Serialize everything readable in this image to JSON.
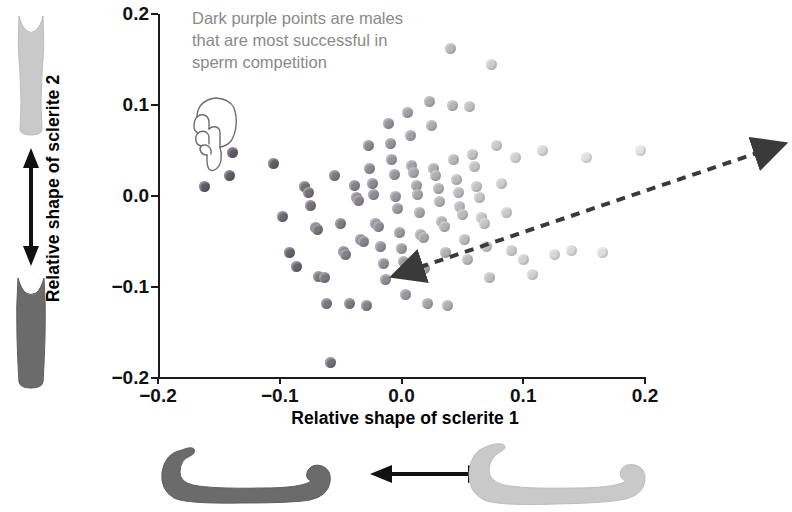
{
  "figure": {
    "annotation": "Dark purple points are males that are most successful in sperm competition",
    "annotation_lines": [
      "Dark purple points are males",
      "that are most successful in",
      "sperm competition"
    ],
    "hand_icon": "pointing-hand-down-icon",
    "colors": {
      "axis": "#1b1b1b",
      "annotation_text": "#8a8a8a",
      "label_text": "#000000",
      "point_dark": "#5a5360",
      "point_light": "#e4e3e6",
      "trend_arrow": "#3a3a3a",
      "sclerite_dark": "#6b6b6b",
      "sclerite_light": "#c9c9c9"
    },
    "left_illustration": {
      "top_shape_label": "sclerite-2-light-form",
      "bottom_shape_label": "sclerite-2-dark-form",
      "arrow_label": "vertical-double-arrow"
    },
    "bottom_illustration": {
      "left_shape_label": "sclerite-1-dark-form",
      "right_shape_label": "sclerite-1-light-form",
      "arrow_label": "horizontal-double-arrow"
    },
    "trend_line": {
      "style": "dashed-double-headed-arrow",
      "from": [
        -0.115,
        -0.063
      ],
      "to": [
        0.163,
        0.063
      ]
    }
  },
  "chart_data": {
    "type": "scatter",
    "title": "",
    "xlabel": "Relative shape of sclerite 1",
    "ylabel": "Relative shape of sclerite 2",
    "xlim": [
      -0.2,
      0.2
    ],
    "ylim": [
      -0.2,
      0.2
    ],
    "xticks": [
      -0.2,
      -0.1,
      0.0,
      0.1,
      0.2
    ],
    "yticks": [
      -0.2,
      -0.1,
      0.0,
      0.1,
      0.2
    ],
    "xticklabels": [
      "−0.2",
      "−0.1",
      "0.0",
      "0.1",
      "0.2"
    ],
    "yticklabels": [
      "−0.2",
      "−0.1",
      "0.0",
      "0.1",
      "0.2"
    ],
    "grid": false,
    "legend": null,
    "colormap": {
      "description": "point darkness encodes sperm competition success; dark purple = most successful",
      "dark": "#5a5360",
      "light": "#e4e3e6"
    },
    "points": [
      {
        "x": -0.162,
        "y": 0.01,
        "shade": 0.05
      },
      {
        "x": -0.141,
        "y": 0.022,
        "shade": 0.05
      },
      {
        "x": -0.139,
        "y": 0.048,
        "shade": 0.05
      },
      {
        "x": -0.105,
        "y": 0.036,
        "shade": 0.07
      },
      {
        "x": -0.098,
        "y": -0.022,
        "shade": 0.14
      },
      {
        "x": -0.092,
        "y": -0.062,
        "shade": 0.1
      },
      {
        "x": -0.086,
        "y": -0.078,
        "shade": 0.12
      },
      {
        "x": -0.08,
        "y": 0.01,
        "shade": 0.18
      },
      {
        "x": -0.076,
        "y": 0.004,
        "shade": 0.2
      },
      {
        "x": -0.075,
        "y": -0.01,
        "shade": 0.2
      },
      {
        "x": -0.071,
        "y": -0.035,
        "shade": 0.22
      },
      {
        "x": -0.069,
        "y": -0.037,
        "shade": 0.22
      },
      {
        "x": -0.068,
        "y": -0.088,
        "shade": 0.25
      },
      {
        "x": -0.063,
        "y": -0.09,
        "shade": 0.25
      },
      {
        "x": -0.062,
        "y": -0.118,
        "shade": 0.24
      },
      {
        "x": -0.058,
        "y": -0.183,
        "shade": 0.18
      },
      {
        "x": -0.055,
        "y": 0.022,
        "shade": 0.26
      },
      {
        "x": -0.05,
        "y": -0.03,
        "shade": 0.28
      },
      {
        "x": -0.048,
        "y": -0.061,
        "shade": 0.3
      },
      {
        "x": -0.046,
        "y": -0.064,
        "shade": 0.3
      },
      {
        "x": -0.043,
        "y": -0.118,
        "shade": 0.27
      },
      {
        "x": -0.039,
        "y": 0.012,
        "shade": 0.32
      },
      {
        "x": -0.037,
        "y": -0.002,
        "shade": 0.33
      },
      {
        "x": -0.035,
        "y": -0.005,
        "shade": 0.33
      },
      {
        "x": -0.034,
        "y": -0.048,
        "shade": 0.34
      },
      {
        "x": -0.031,
        "y": -0.05,
        "shade": 0.34
      },
      {
        "x": -0.029,
        "y": -0.12,
        "shade": 0.3
      },
      {
        "x": -0.027,
        "y": 0.056,
        "shade": 0.36
      },
      {
        "x": -0.026,
        "y": 0.03,
        "shade": 0.37
      },
      {
        "x": -0.024,
        "y": 0.014,
        "shade": 0.38
      },
      {
        "x": -0.023,
        "y": 0.002,
        "shade": 0.39
      },
      {
        "x": -0.021,
        "y": -0.03,
        "shade": 0.4
      },
      {
        "x": -0.019,
        "y": -0.033,
        "shade": 0.4
      },
      {
        "x": -0.017,
        "y": -0.055,
        "shade": 0.41
      },
      {
        "x": -0.015,
        "y": -0.074,
        "shade": 0.41
      },
      {
        "x": -0.013,
        "y": -0.092,
        "shade": 0.4
      },
      {
        "x": -0.011,
        "y": 0.08,
        "shade": 0.43
      },
      {
        "x": -0.009,
        "y": 0.058,
        "shade": 0.44
      },
      {
        "x": -0.008,
        "y": 0.04,
        "shade": 0.45
      },
      {
        "x": -0.006,
        "y": 0.024,
        "shade": 0.46
      },
      {
        "x": -0.005,
        "y": 0.0,
        "shade": 0.47
      },
      {
        "x": -0.003,
        "y": -0.014,
        "shade": 0.48
      },
      {
        "x": -0.002,
        "y": -0.04,
        "shade": 0.48
      },
      {
        "x": 0.0,
        "y": -0.058,
        "shade": 0.49
      },
      {
        "x": 0.002,
        "y": -0.072,
        "shade": 0.49
      },
      {
        "x": 0.003,
        "y": -0.108,
        "shade": 0.47
      },
      {
        "x": 0.005,
        "y": 0.092,
        "shade": 0.52
      },
      {
        "x": 0.007,
        "y": 0.066,
        "shade": 0.53
      },
      {
        "x": 0.008,
        "y": 0.034,
        "shade": 0.54
      },
      {
        "x": 0.01,
        "y": 0.026,
        "shade": 0.55
      },
      {
        "x": 0.012,
        "y": 0.012,
        "shade": 0.55
      },
      {
        "x": 0.013,
        "y": 0.002,
        "shade": 0.56
      },
      {
        "x": 0.015,
        "y": -0.018,
        "shade": 0.56
      },
      {
        "x": 0.016,
        "y": -0.042,
        "shade": 0.57
      },
      {
        "x": 0.018,
        "y": -0.046,
        "shade": 0.57
      },
      {
        "x": 0.019,
        "y": -0.08,
        "shade": 0.56
      },
      {
        "x": 0.021,
        "y": -0.118,
        "shade": 0.54
      },
      {
        "x": 0.023,
        "y": 0.104,
        "shade": 0.6
      },
      {
        "x": 0.025,
        "y": 0.078,
        "shade": 0.61
      },
      {
        "x": 0.026,
        "y": 0.03,
        "shade": 0.62
      },
      {
        "x": 0.028,
        "y": 0.022,
        "shade": 0.63
      },
      {
        "x": 0.03,
        "y": 0.008,
        "shade": 0.63
      },
      {
        "x": 0.031,
        "y": -0.006,
        "shade": 0.64
      },
      {
        "x": 0.033,
        "y": -0.028,
        "shade": 0.64
      },
      {
        "x": 0.035,
        "y": -0.034,
        "shade": 0.65
      },
      {
        "x": 0.036,
        "y": -0.062,
        "shade": 0.64
      },
      {
        "x": 0.038,
        "y": -0.12,
        "shade": 0.62
      },
      {
        "x": 0.04,
        "y": 0.162,
        "shade": 0.7
      },
      {
        "x": 0.042,
        "y": 0.1,
        "shade": 0.68
      },
      {
        "x": 0.043,
        "y": 0.04,
        "shade": 0.69
      },
      {
        "x": 0.045,
        "y": 0.018,
        "shade": 0.7
      },
      {
        "x": 0.047,
        "y": 0.004,
        "shade": 0.7
      },
      {
        "x": 0.048,
        "y": -0.012,
        "shade": 0.71
      },
      {
        "x": 0.05,
        "y": -0.02,
        "shade": 0.71
      },
      {
        "x": 0.052,
        "y": -0.048,
        "shade": 0.71
      },
      {
        "x": 0.054,
        "y": -0.07,
        "shade": 0.7
      },
      {
        "x": 0.056,
        "y": 0.098,
        "shade": 0.75
      },
      {
        "x": 0.058,
        "y": 0.046,
        "shade": 0.76
      },
      {
        "x": 0.06,
        "y": 0.032,
        "shade": 0.77
      },
      {
        "x": 0.062,
        "y": 0.01,
        "shade": 0.77
      },
      {
        "x": 0.064,
        "y": -0.002,
        "shade": 0.78
      },
      {
        "x": 0.066,
        "y": -0.024,
        "shade": 0.78
      },
      {
        "x": 0.068,
        "y": -0.03,
        "shade": 0.78
      },
      {
        "x": 0.07,
        "y": -0.056,
        "shade": 0.77
      },
      {
        "x": 0.072,
        "y": -0.09,
        "shade": 0.76
      },
      {
        "x": 0.074,
        "y": 0.144,
        "shade": 0.84
      },
      {
        "x": 0.078,
        "y": 0.056,
        "shade": 0.82
      },
      {
        "x": 0.082,
        "y": 0.014,
        "shade": 0.83
      },
      {
        "x": 0.086,
        "y": -0.018,
        "shade": 0.83
      },
      {
        "x": 0.09,
        "y": -0.06,
        "shade": 0.82
      },
      {
        "x": 0.094,
        "y": 0.042,
        "shade": 0.86
      },
      {
        "x": 0.1,
        "y": -0.07,
        "shade": 0.86
      },
      {
        "x": 0.108,
        "y": -0.086,
        "shade": 0.87
      },
      {
        "x": 0.116,
        "y": 0.05,
        "shade": 0.9
      },
      {
        "x": 0.126,
        "y": -0.064,
        "shade": 0.91
      },
      {
        "x": 0.14,
        "y": -0.06,
        "shade": 0.93
      },
      {
        "x": 0.152,
        "y": 0.042,
        "shade": 0.96
      },
      {
        "x": 0.165,
        "y": -0.062,
        "shade": 0.96
      },
      {
        "x": 0.196,
        "y": 0.05,
        "shade": 0.99
      }
    ]
  }
}
